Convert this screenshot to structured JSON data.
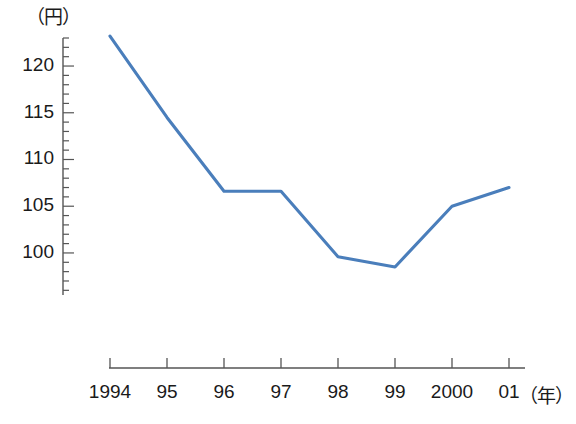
{
  "chart_data": {
    "type": "line",
    "title": "",
    "xlabel": "（年）",
    "ylabel": "（円）",
    "categories": [
      "1994",
      "95",
      "96",
      "97",
      "98",
      "99",
      "2000",
      "01"
    ],
    "x": [
      1994,
      1995,
      1996,
      1997,
      1998,
      1999,
      2000,
      2001
    ],
    "values": [
      123.2,
      114.5,
      106.6,
      106.6,
      99.6,
      98.5,
      105.0,
      107.0
    ],
    "series": [
      {
        "name": "円相場",
        "values": [
          123.2,
          114.5,
          106.6,
          106.6,
          99.6,
          98.5,
          105.0,
          107.0
        ]
      }
    ],
    "ytick_labels": [
      "120",
      "115",
      "110",
      "105",
      "100"
    ],
    "ytick_values": [
      120,
      115,
      110,
      105,
      100
    ],
    "yminor_step": 1,
    "ylim": [
      97.3,
      125.0
    ],
    "xlim": [
      1993.6,
      2001.3
    ],
    "grid": false,
    "legend": false,
    "line_color": "#4a7ebb",
    "axis_color": "#555555",
    "text_color": "#1a1a1a"
  },
  "axis": {
    "y_unit_label": "（円）",
    "x_unit_label": "（年）"
  }
}
